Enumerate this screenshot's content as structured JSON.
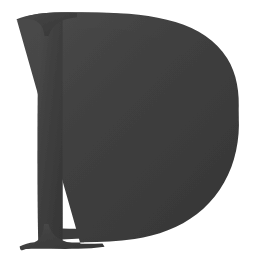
{
  "document": {
    "kind": "letter-specimen",
    "title": "Letter D specimen",
    "character": "D",
    "script": "Latin",
    "case": "uppercase",
    "style": "serif",
    "alt_text": "Large serif capital letter D in dark gray on a white background"
  },
  "canvas": {
    "width": 266,
    "height": 267,
    "background_color": "#ffffff"
  },
  "glyph": {
    "character": "D",
    "ink_color": "#3f3f3f",
    "ink_color_light": "#4a4a4a",
    "ink_color_dark": "#353535",
    "texture": "scanned-grain",
    "metrics": {
      "cap_top_y": 13,
      "baseline_y": 249,
      "cap_height": 236,
      "stem_left_x": 38,
      "stem_right_x": 62,
      "stem_width": 24,
      "bowl_right_x": 238,
      "top_serif_left_x": 17,
      "top_serif_right_x": 65,
      "bottom_serif_left_x": 20,
      "bottom_serif_right_x": 105,
      "counter_left_x": 62,
      "counter_right_x": 205,
      "counter_top_y": 32,
      "counter_bottom_y": 228
    },
    "outline_path": "M 17.5 19.0 C 26 15.5 33 13.8 41 13.2 C 57 12.2 78 12.0 99 12.2 C 128 12.5 155 14.6 177 20.6 C 199 26.8 216 37.6 227 53.0 C 238.5 69.2 244.0 89.5 244.4 112.5 C 244.8 136.5 239.6 159.4 229.2 178.2 C 218.6 197.4 203.0 212.6 184.2 222.8 C 165.6 232.9 144.4 238.6 122.0 240.6 C 109.0 241.8 96.0 242.4 83.0 242.6 C 66.0 242.9 48.0 243.2 31.0 244.6 C 26.5 245.0 23.0 246.0 20.0 247.6 L 20.6 249.2 C 30.0 246.0 38.0 244.6 46.5 244.2 C 55.0 243.8 63.5 243.9 72.0 243.8 L 72.0 241.0 C 63.5 241.1 55.0 241.0 46.5 241.4 C 39.5 241.7 32.5 242.6 25.5 244.3 L 25.5 244.3 Z",
    "stroke_note": "bowl is a thick bracketed curve; stem is a vertical slab with flared serifs top and bottom"
  },
  "labels": {
    "character_label": "D",
    "caption": ""
  }
}
